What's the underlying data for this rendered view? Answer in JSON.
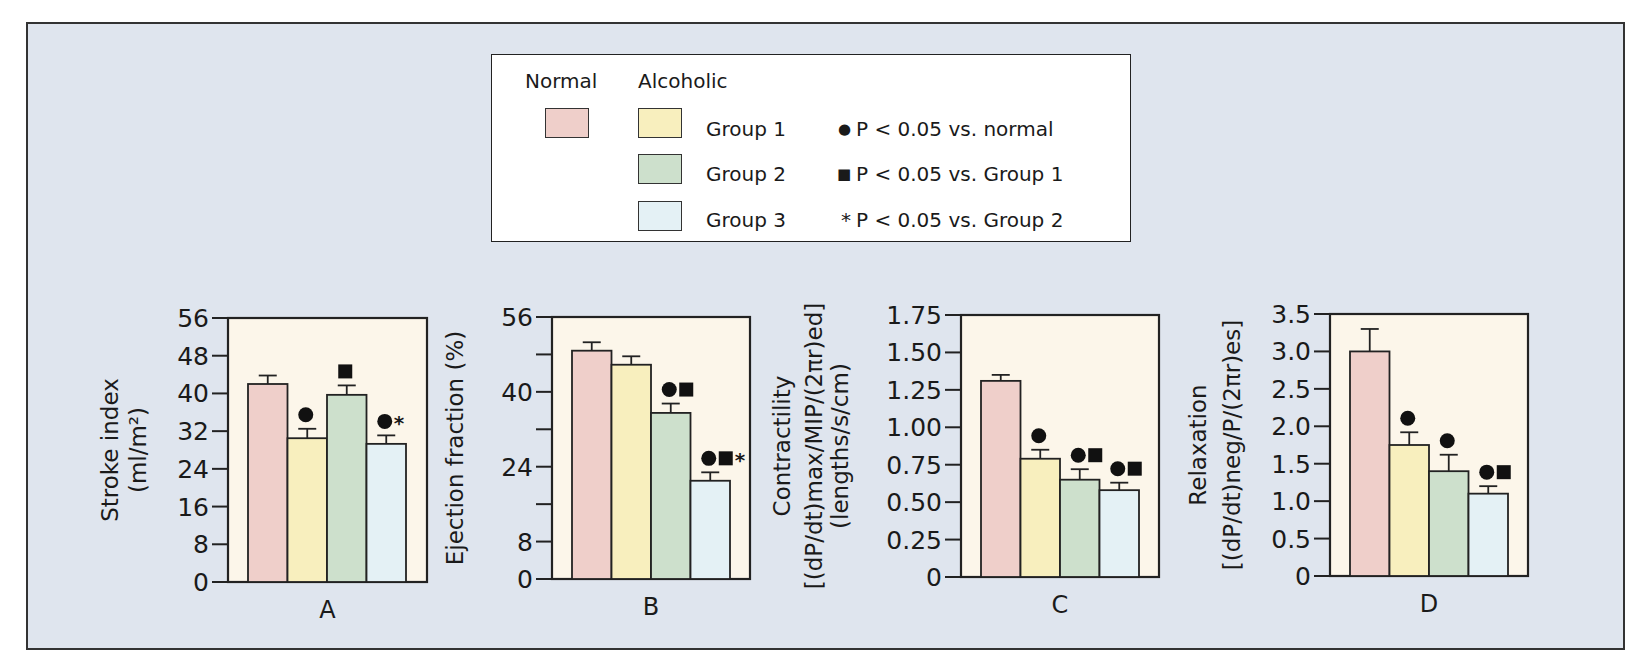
{
  "legend": {
    "normal_header": "Normal",
    "alcoholic_header": "Alcoholic",
    "groups": [
      {
        "key": "normal",
        "label": "",
        "color": "#efcfca"
      },
      {
        "key": "g1",
        "label": "Group 1",
        "color": "#f8efbe"
      },
      {
        "key": "g2",
        "label": "Group 2",
        "color": "#cde0cc"
      },
      {
        "key": "g3",
        "label": "Group 3",
        "color": "#e4f1f5"
      }
    ],
    "significance": [
      {
        "symbol": "●",
        "text": "P < 0.05 vs. normal"
      },
      {
        "symbol": "■",
        "text": "P < 0.05 vs. Group 1"
      },
      {
        "symbol": "*",
        "text": "P < 0.05 vs. Group 2"
      }
    ]
  },
  "colors": {
    "background": "#dfe5ee",
    "plot_area": "#fcf6ea",
    "normal": "#efcfca",
    "group1": "#f8efbe",
    "group2": "#cde0cc",
    "group3": "#e4f1f5"
  },
  "chart_data": [
    {
      "type": "bar",
      "panel": "A",
      "title": "",
      "xlabel": "A",
      "ylabel": [
        "Stroke index",
        "(ml/m²)"
      ],
      "ylim": [
        0,
        56
      ],
      "yticks": [
        0,
        8,
        16,
        24,
        32,
        40,
        48,
        56
      ],
      "ytick_labels": [
        "0",
        "8",
        "16",
        "24",
        "32",
        "40",
        "48",
        "56"
      ],
      "categories": [
        "Normal",
        "Group 1",
        "Group 2",
        "Group 3"
      ],
      "values": [
        42,
        30.5,
        39.7,
        29.3
      ],
      "errors": [
        1.8,
        2.0,
        2.0,
        1.8
      ],
      "markers": [
        "",
        "●",
        "■",
        "●*"
      ]
    },
    {
      "type": "bar",
      "panel": "B",
      "title": "",
      "xlabel": "B",
      "ylabel": [
        "Ejection fraction (%)"
      ],
      "ylim": [
        0,
        56
      ],
      "yticks": [
        0,
        8,
        16,
        24,
        32,
        40,
        48,
        56
      ],
      "ytick_labels": [
        "0",
        "8",
        "",
        "24",
        "",
        "40",
        "",
        "56"
      ],
      "categories": [
        "Normal",
        "Group 1",
        "Group 2",
        "Group 3"
      ],
      "values": [
        48.8,
        45.8,
        35.5,
        21.0
      ],
      "errors": [
        1.8,
        1.8,
        2.0,
        1.8
      ],
      "markers": [
        "",
        "",
        "●■",
        "●■*"
      ]
    },
    {
      "type": "bar",
      "panel": "C",
      "title": "",
      "xlabel": "C",
      "ylabel": [
        "Contractility",
        "[(dP/dt)max/MIP/(2πr)ed]",
        "(lengths/s/cm)"
      ],
      "ylim": [
        0,
        1.75
      ],
      "yticks": [
        0,
        0.25,
        0.5,
        0.75,
        1.0,
        1.25,
        1.5,
        1.75
      ],
      "ytick_labels": [
        "0",
        "0.25",
        "0.50",
        "0.75",
        "1.00",
        "1.25",
        "1.50",
        "1.75"
      ],
      "categories": [
        "Normal",
        "Group 1",
        "Group 2",
        "Group 3"
      ],
      "values": [
        1.31,
        0.79,
        0.65,
        0.58
      ],
      "errors": [
        0.04,
        0.06,
        0.07,
        0.05
      ],
      "markers": [
        "",
        "●",
        "●■",
        "●■"
      ]
    },
    {
      "type": "bar",
      "panel": "D",
      "title": "",
      "xlabel": "D",
      "ylabel": [
        "Relaxation",
        "[(dP/dt)neg/P/(2πr)es]"
      ],
      "ylim": [
        0,
        3.5
      ],
      "yticks": [
        0,
        0.5,
        1.0,
        1.5,
        2.0,
        2.5,
        3.0,
        3.5
      ],
      "ytick_labels": [
        "0",
        "0.5",
        "1.0",
        "1.5",
        "2.0",
        "2.5",
        "3.0",
        "3.5"
      ],
      "categories": [
        "Normal",
        "Group 1",
        "Group 2",
        "Group 3"
      ],
      "values": [
        3.0,
        1.75,
        1.4,
        1.1
      ],
      "errors": [
        0.3,
        0.17,
        0.22,
        0.1
      ],
      "markers": [
        "",
        "●",
        "●",
        "●■"
      ]
    }
  ]
}
